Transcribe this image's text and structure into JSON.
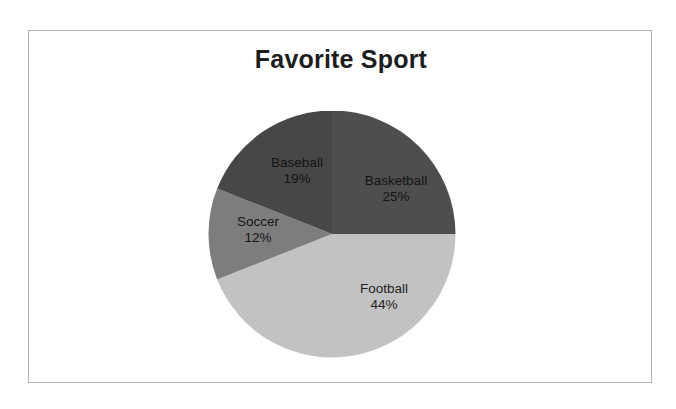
{
  "chart_data": {
    "type": "pie",
    "title": "Favorite Sport",
    "xlabel": "",
    "ylabel": "",
    "legend": "none",
    "grid": false,
    "units": "percent",
    "start_angle_deg": 0,
    "direction": "clockwise",
    "categories": [
      "Basketball",
      "Football",
      "Soccer",
      "Baseball"
    ],
    "values": [
      25,
      44,
      12,
      19
    ],
    "labels": [
      "Basketball",
      "Football",
      "Soccer",
      "Baseball"
    ],
    "slices": [
      {
        "name": "Basketball",
        "value": 25,
        "pct_text": "25%",
        "color": "#4e4e4e",
        "label_tone": "dark"
      },
      {
        "name": "Football",
        "value": 44,
        "pct_text": "44%",
        "color": "#c2c2c2",
        "label_tone": "light"
      },
      {
        "name": "Soccer",
        "value": 12,
        "pct_text": "12%",
        "color": "#7d7d7d",
        "label_tone": "dark"
      },
      {
        "name": "Baseball",
        "value": 19,
        "pct_text": "19%",
        "color": "#474747",
        "label_tone": "dark"
      }
    ]
  },
  "frame": {
    "border_color": "#b0b0b0",
    "background": "#ffffff"
  }
}
